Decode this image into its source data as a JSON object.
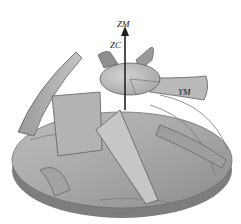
{
  "figure": {
    "labels": {
      "zm": "ZM",
      "zc": "ZC",
      "ym": "YM"
    },
    "colors": {
      "background": "#ffffff",
      "surface_light": "#c8c8c8",
      "surface_mid": "#a9a9a9",
      "surface_dark": "#7a7a7a",
      "edge": "#555555",
      "axis": "#222222"
    }
  }
}
